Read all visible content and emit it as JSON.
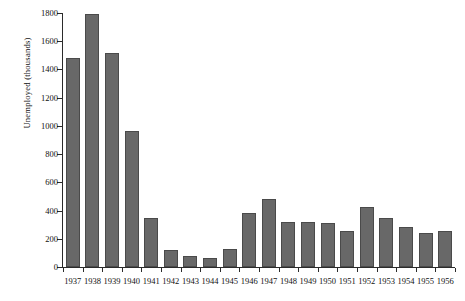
{
  "chart_data": {
    "type": "bar",
    "title": "",
    "xlabel": "",
    "ylabel": "Unemployed (thousands)",
    "categories": [
      "1937",
      "1938",
      "1939",
      "1940",
      "1941",
      "1942",
      "1943",
      "1944",
      "1945",
      "1946",
      "1947",
      "1948",
      "1949",
      "1950",
      "1951",
      "1952",
      "1953",
      "1954",
      "1955",
      "1956"
    ],
    "values": [
      1480,
      1795,
      1520,
      965,
      350,
      120,
      75,
      65,
      130,
      385,
      485,
      320,
      320,
      315,
      255,
      425,
      345,
      285,
      240,
      255
    ],
    "ylim": [
      0,
      1800
    ],
    "yticks": [
      0,
      200,
      400,
      600,
      800,
      1000,
      1200,
      1400,
      1600,
      1800
    ],
    "ytick_labels": [
      "0",
      "200",
      "400",
      "600",
      "800",
      "1000",
      "1200",
      "1400",
      "1600",
      "1800"
    ],
    "grid": false,
    "legend": false,
    "bar_color": "#686868",
    "bar_edge_color": "#4a4a4a",
    "axis_color": "#2b2b2b"
  }
}
